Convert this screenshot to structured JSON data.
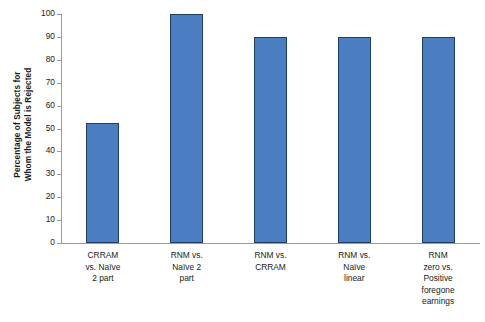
{
  "chart_data": {
    "type": "bar",
    "title": "",
    "xlabel": "",
    "ylabel": "Percentage of Subjects for Whom the Model is Rejected",
    "ylabel_lines": [
      "Percentage of Subjects for",
      "Whom the Model is Rejected"
    ],
    "categories": [
      "CRRAM vs. Naïve 2 part",
      "RNM vs. Naïve 2 part",
      "RNM vs. CRRAM",
      "RNM vs. Naïve linear",
      "RNM zero vs. Positive foregone earnings"
    ],
    "category_lines": [
      [
        "CRRAM",
        "vs. Naïve",
        "2 part"
      ],
      [
        "RNM vs.",
        "Naïve 2",
        "part"
      ],
      [
        "RNM vs.",
        "CRRAM"
      ],
      [
        "RNM vs.",
        "Naïve",
        "linear"
      ],
      [
        "RNM",
        "zero vs.",
        "Positive",
        "foregone",
        "earnings"
      ]
    ],
    "values": [
      52.5,
      100,
      90,
      90,
      90
    ],
    "ylim": [
      0,
      100
    ],
    "ytick_values": [
      0,
      10,
      20,
      30,
      40,
      50,
      60,
      70,
      80,
      90,
      100
    ],
    "ytick_labels": [
      "0",
      "10",
      "20",
      "30",
      "40",
      "50",
      "60",
      "70",
      "80",
      "90",
      "100"
    ],
    "grid": false,
    "legend": false,
    "bar_color": "#4a7ec0",
    "bar_edge_color": "#1f3f66",
    "axis_color": "#9a9a9a",
    "background_color": "#ffffff"
  }
}
